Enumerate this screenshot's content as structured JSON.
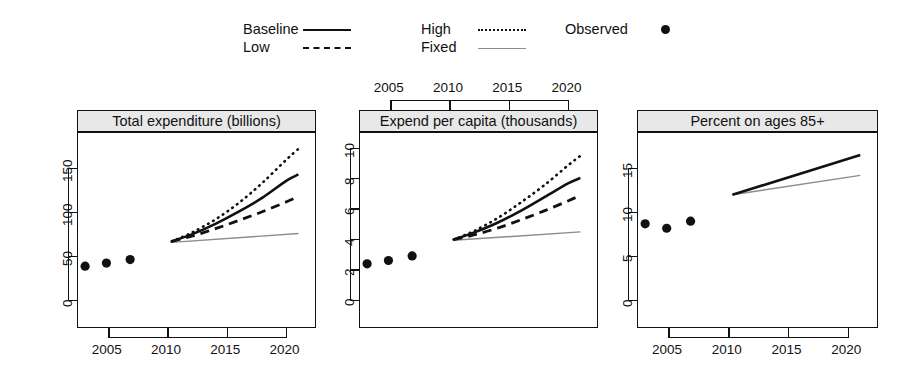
{
  "legend": {
    "entries": [
      {
        "label": "Baseline",
        "style": "solid",
        "name": "legend-baseline"
      },
      {
        "label": "Low",
        "style": "dashed",
        "name": "legend-low"
      },
      {
        "label": "High",
        "style": "dotted",
        "name": "legend-high"
      },
      {
        "label": "Fixed",
        "style": "thin",
        "name": "legend-fixed"
      },
      {
        "label": "Observed",
        "style": "dot",
        "name": "legend-observed"
      }
    ]
  },
  "colors": {
    "line": "#111111",
    "fixed_line": "#8c8c8c",
    "strip_bg": "#e8e8e8",
    "frame": "#111111",
    "background": "#ffffff"
  },
  "chart_data": [
    {
      "type": "line",
      "title": "Total expenditure (billions)",
      "panel_index": 0,
      "xlabel": "",
      "ylabel": "",
      "xlim": [
        2002.4,
        2022.4
      ],
      "ylim": [
        -30,
        190
      ],
      "xticks": [
        2005,
        2010,
        2015,
        2020
      ],
      "xticklabels": [
        "2005",
        "2010",
        "2015",
        "2020"
      ],
      "xticks_position": "bottom",
      "yticks": [
        0,
        50,
        100,
        150
      ],
      "yticklabels": [
        "0",
        "50",
        "100",
        "150"
      ],
      "grid": false,
      "observed": {
        "name": "Observed",
        "x": [
          2003.0,
          2004.8,
          2006.8
        ],
        "y": [
          39,
          42.5,
          46.5
        ]
      },
      "series": [
        {
          "name": "Baseline",
          "style": "solid",
          "x": [
            2010.3,
            2012,
            2014,
            2016,
            2018,
            2020,
            2021.0
          ],
          "y": [
            67,
            75,
            87,
            101,
            117,
            136,
            143
          ]
        },
        {
          "name": "Low",
          "style": "dashed",
          "x": [
            2010.3,
            2012,
            2014,
            2016,
            2018,
            2020,
            2021.0
          ],
          "y": [
            67,
            73,
            81.5,
            91,
            101,
            112,
            118
          ]
        },
        {
          "name": "High",
          "style": "dotted",
          "x": [
            2010.3,
            2012,
            2014,
            2016,
            2018,
            2020,
            2021.0
          ],
          "y": [
            67,
            77,
            92,
            111,
            134,
            160,
            172
          ]
        },
        {
          "name": "Fixed",
          "style": "thin",
          "x": [
            2010.3,
            2021.0
          ],
          "y": [
            66,
            76
          ]
        }
      ]
    },
    {
      "type": "line",
      "title": "Expend per capita (thousands)",
      "panel_index": 1,
      "xlabel": "",
      "ylabel": "",
      "xlim": [
        2002.4,
        2022.4
      ],
      "ylim": [
        -1.75,
        11.0
      ],
      "xticks": [
        2005,
        2010,
        2015,
        2020
      ],
      "xticklabels": [
        "2005",
        "2010",
        "2015",
        "2020"
      ],
      "xticks_position": "top",
      "yticks": [
        0,
        2,
        4,
        6,
        8,
        10
      ],
      "yticklabels": [
        "0",
        "2",
        "4",
        "6",
        "8",
        "10"
      ],
      "grid": false,
      "observed": {
        "name": "Observed",
        "x": [
          2003.0,
          2004.8,
          2006.8
        ],
        "y": [
          2.4,
          2.62,
          2.92
        ]
      },
      "series": [
        {
          "name": "Baseline",
          "style": "solid",
          "x": [
            2010.3,
            2012,
            2014,
            2016,
            2018,
            2020,
            2021.0
          ],
          "y": [
            4.0,
            4.45,
            5.1,
            5.9,
            6.8,
            7.7,
            8.05
          ]
        },
        {
          "name": "Low",
          "style": "dashed",
          "x": [
            2010.3,
            2012,
            2014,
            2016,
            2018,
            2020,
            2021.0
          ],
          "y": [
            4.0,
            4.3,
            4.75,
            5.3,
            5.9,
            6.55,
            6.9
          ]
        },
        {
          "name": "High",
          "style": "dotted",
          "x": [
            2010.3,
            2012,
            2014,
            2016,
            2018,
            2020,
            2021.0
          ],
          "y": [
            4.0,
            4.55,
            5.4,
            6.45,
            7.6,
            8.9,
            9.5
          ]
        },
        {
          "name": "Fixed",
          "style": "thin",
          "x": [
            2010.3,
            2021.0
          ],
          "y": [
            3.95,
            4.5
          ]
        }
      ]
    },
    {
      "type": "line",
      "title": "Percent on ages 85+",
      "panel_index": 2,
      "xlabel": "",
      "ylabel": "",
      "xlim": [
        2002.4,
        2022.4
      ],
      "ylim": [
        -3.0,
        19.0
      ],
      "xticks": [
        2005,
        2010,
        2015,
        2020
      ],
      "xticklabels": [
        "2005",
        "2010",
        "2015",
        "2020"
      ],
      "xticks_position": "bottom",
      "yticks": [
        0,
        5,
        10,
        15
      ],
      "yticklabels": [
        "0",
        "5",
        "10",
        "15"
      ],
      "grid": false,
      "observed": {
        "name": "Observed",
        "x": [
          2003.0,
          2004.8,
          2006.8
        ],
        "y": [
          8.7,
          8.2,
          9.0
        ]
      },
      "series": [
        {
          "name": "Baseline",
          "style": "solid",
          "x": [
            2010.3,
            2021.0
          ],
          "y": [
            12.0,
            16.5
          ]
        },
        {
          "name": "Fixed",
          "style": "thin",
          "x": [
            2010.3,
            2021.0
          ],
          "y": [
            12.0,
            14.2
          ]
        }
      ]
    }
  ],
  "panel_geometry": [
    {
      "left": 77,
      "top": 110,
      "width": 239,
      "height": 218
    },
    {
      "left": 359,
      "top": 110,
      "width": 239,
      "height": 218
    },
    {
      "left": 637,
      "top": 110,
      "width": 241,
      "height": 218
    }
  ]
}
